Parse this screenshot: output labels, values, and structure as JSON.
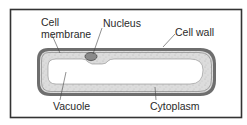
{
  "diagram": {
    "labels": {
      "cell_membrane_line1": "Cell",
      "cell_membrane_line2": "membrane",
      "nucleus": "Nucleus",
      "cell_wall": "Cell wall",
      "vacuole": "Vacuole",
      "cytoplasm": "Cytoplasm"
    },
    "colors": {
      "frame": "#333333",
      "cell_wall": "#6b6b6b",
      "cytoplasm": "#d9d9d9",
      "vacuole": "#ffffff",
      "nucleus": "#8a8a8a",
      "leader_line": "#444444",
      "text": "#2a2a2a"
    }
  }
}
